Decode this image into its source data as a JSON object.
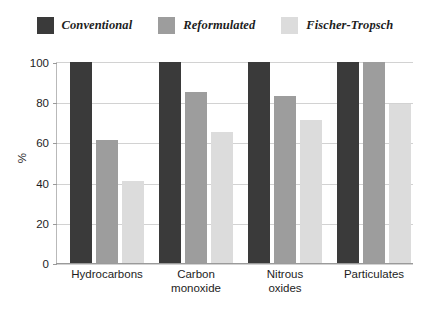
{
  "chart_data": {
    "type": "bar",
    "title": "",
    "subtitle": "",
    "xlabel": "",
    "ylabel": "%",
    "ylim": [
      0,
      100
    ],
    "yticks": [
      0,
      20,
      40,
      60,
      80,
      100
    ],
    "ytick_labels": [
      "0",
      "20",
      "40",
      "60",
      "80",
      "100"
    ],
    "grid": true,
    "legend_position": "top-center",
    "categories": [
      "Hydrocarbons",
      "Carbon monoxide",
      "Nitrous oxides",
      "Particulates"
    ],
    "category_label_lines": [
      [
        "Hydrocarbons"
      ],
      [
        "Carbon",
        "monoxide"
      ],
      [
        "Nitrous",
        "oxides"
      ],
      [
        "Particulates"
      ]
    ],
    "series": [
      {
        "name": "Conventional",
        "color": "#3a3a3a",
        "values": [
          100,
          100,
          100,
          100
        ]
      },
      {
        "name": "Reformulated",
        "color": "#9d9d9d",
        "values": [
          61,
          85,
          83,
          100
        ]
      },
      {
        "name": "Fischer-Tropsch",
        "color": "#dcdcdc",
        "values": [
          41,
          65,
          71,
          79
        ]
      }
    ]
  },
  "legend": {
    "entries": [
      {
        "label": "Conventional",
        "color": "#3a3a3a"
      },
      {
        "label": "Reformulated",
        "color": "#9d9d9d"
      },
      {
        "label": "Fischer-Tropsch",
        "color": "#dcdcdc"
      }
    ]
  },
  "colors": {
    "conventional": "#3a3a3a",
    "reformulated": "#9d9d9d",
    "fischer_tropsch": "#dcdcdc",
    "gridline": "#d2d2d2",
    "axis": "#9a9a9a",
    "text": "#1d1d1d",
    "background": "#ffffff"
  }
}
